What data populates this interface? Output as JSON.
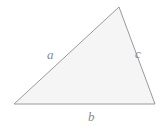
{
  "figure": {
    "name": "triangle-side-labels",
    "background_color": "#ffffff",
    "shape": {
      "type": "triangle",
      "fill_color": "#f5f5f5",
      "stroke_color": "#9a9a9a",
      "stroke_width": 1,
      "vertices": [
        {
          "name": "left-vertex",
          "x": 14,
          "y": 104
        },
        {
          "name": "apex-vertex",
          "x": 119,
          "y": 7
        },
        {
          "name": "right-vertex",
          "x": 155,
          "y": 104
        }
      ]
    },
    "labels": [
      {
        "id": "a",
        "text": "a",
        "side": "left-side",
        "x": 47,
        "y": 48,
        "color": "#8a8a8a"
      },
      {
        "id": "b",
        "text": "b",
        "side": "bottom-side",
        "x": 88,
        "y": 110,
        "color": "#8a8a8a"
      },
      {
        "id": "c",
        "text": "c",
        "side": "right-side",
        "x": 135,
        "y": 47,
        "color": "#8a8a8a"
      }
    ]
  }
}
